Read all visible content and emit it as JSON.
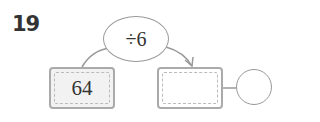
{
  "problem": {
    "number": "19",
    "operation": "÷6",
    "input_value": "64",
    "output_value": "",
    "remainder_value": ""
  },
  "colors": {
    "box_border": "#aaaaaa",
    "input_fill": "#f2f2f2",
    "line": "#999999"
  }
}
